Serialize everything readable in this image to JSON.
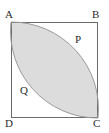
{
  "figure": {
    "name": "square-with-shaded-lens",
    "background_color": "#ffffff",
    "stroke_color": "#6b6b6b",
    "fill_color": "#dcdcdc",
    "label_color": "#2b2b2b",
    "square": {
      "name": "square-ABCD",
      "left": 11,
      "top": 22,
      "size": 87,
      "stroke_width": 1
    },
    "vertices": [
      {
        "id": "A",
        "label": "A",
        "corner": "top-left",
        "x": 11,
        "y": 22
      },
      {
        "id": "B",
        "label": "B",
        "corner": "top-right",
        "x": 98,
        "y": 22
      },
      {
        "id": "C",
        "label": "C",
        "corner": "bottom-right",
        "x": 98,
        "y": 118
      },
      {
        "id": "D",
        "label": "D",
        "corner": "bottom-left",
        "x": 11,
        "y": 118
      }
    ],
    "region_labels": [
      {
        "id": "P",
        "label": "P",
        "x": 78,
        "y": 40,
        "describes": "unshaded region near B, above upper arc"
      },
      {
        "id": "Q",
        "label": "Q",
        "x": 24,
        "y": 92,
        "describes": "unshaded region near D, below lower arc"
      }
    ],
    "lens": {
      "name": "shaded-lens-region",
      "description": "Vesica formed by two circular arcs joining A and C",
      "fill": "#dcdcdc",
      "arcs": [
        {
          "id": "arc-upper",
          "from": "A",
          "to": "C",
          "center": "B",
          "bulges_toward": "B",
          "radius": 87
        },
        {
          "id": "arc-lower",
          "from": "A",
          "to": "C",
          "center": "D",
          "bulges_toward": "D",
          "radius": 87
        }
      ],
      "path": "M 11 22 A 87 87 0 0 1 98 118 A 87 87 0 0 1 11 22 Z"
    }
  }
}
